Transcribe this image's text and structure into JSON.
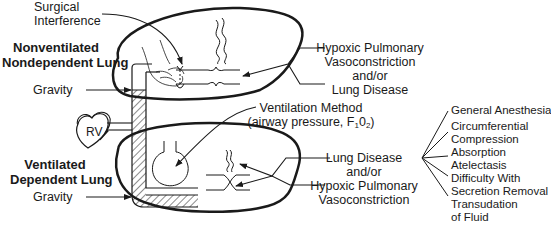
{
  "labels": {
    "surgical_interference": [
      "Surgical",
      "Interference"
    ],
    "nonventilated_lung": [
      "Nonventilated",
      "Nondependent Lung"
    ],
    "gravity_top": "Gravity",
    "rv": "RV",
    "ventilated_lung": [
      "Ventilated",
      "Dependent Lung"
    ],
    "gravity_bottom": "Gravity",
    "upper_causes": [
      "Hypoxic Pulmonary",
      "Vasoconstriction",
      "and/or",
      "Lung Disease"
    ],
    "ventilation_method": [
      "Ventilation Method",
      "(airway pressure, F",
      "1",
      "0",
      "2",
      ")"
    ],
    "lower_causes": [
      "Lung Disease",
      "and/or",
      "Hypoxic Pulmonary",
      "Vasoconstriction"
    ],
    "factors": [
      [
        "General Anesthesia"
      ],
      [
        "Circumferential",
        "Compression"
      ],
      [
        "Absorption",
        "Atelectasis"
      ],
      [
        "Difficulty With",
        "Secretion Removal"
      ],
      [
        "Transudation",
        "of Fluid"
      ]
    ]
  },
  "colors": {
    "ink": "#1a1a1a",
    "background": "#ffffff"
  }
}
